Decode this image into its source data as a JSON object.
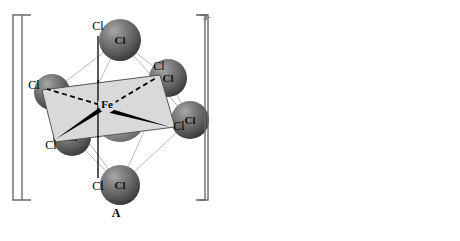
{
  "figure": {
    "charge": "3-",
    "background_color": "#ffffff"
  },
  "colors": {
    "fe_sphere_light": "#e8e8e8",
    "fe_sphere_mid": "#b4b4b4",
    "fe_sphere_dark": "#6e6e6e",
    "cl_sphere_light": "#9a9a9a",
    "cl_sphere_mid": "#6d6d6d",
    "cl_sphere_dark": "#3c3c3c",
    "bond_light": "#d0d0d0",
    "bond_dark": "#8a8a8a",
    "wireframe": "#9b9b9b",
    "bracket": "#6a6a6a",
    "plane_fill": "#d9d9d9",
    "plane_stroke": "#555555",
    "line": "#000000",
    "label_text": "#000000"
  },
  "panel_a": {
    "name": "A",
    "label": "A",
    "charge": "3-",
    "center_atom": {
      "label": "Fe",
      "cx": 120,
      "cy": 115,
      "r": 27
    },
    "ligands": [
      {
        "label": "Cl",
        "position": "top",
        "cx": 120,
        "cy": 40,
        "r": 21
      },
      {
        "label": "Cl",
        "position": "bottom",
        "cx": 120,
        "cy": 185,
        "r": 20
      },
      {
        "label": "Cl",
        "position": "left-rear",
        "cx": 52,
        "cy": 92,
        "r": 18
      },
      {
        "label": "Cl",
        "position": "lower-left",
        "cx": 72,
        "cy": 137,
        "r": 19
      },
      {
        "label": "Cl",
        "position": "upper-right",
        "cx": 168,
        "cy": 78,
        "r": 19
      },
      {
        "label": "Cl",
        "position": "right",
        "cx": 190,
        "cy": 120,
        "r": 19
      }
    ],
    "bracket": {
      "left_x": 22,
      "right_x": 205,
      "top_y": 15,
      "bottom_y": 200
    }
  },
  "panel_b": {
    "name": "B",
    "label": "B",
    "charge": "3-",
    "center_atom": {
      "label": "Fe",
      "x": 337,
      "y": 107
    },
    "ligands": [
      {
        "label": "Cl",
        "position": "axial-top",
        "bond": "plain",
        "x": 328,
        "y": 26
      },
      {
        "label": "Cl",
        "position": "axial-bottom",
        "bond": "plain",
        "x": 328,
        "y": 186
      },
      {
        "label": "Cl",
        "position": "equatorial-left-rear",
        "bond": "dashed",
        "x": 264,
        "y": 85
      },
      {
        "label": "Cl",
        "position": "equatorial-right-rear",
        "bond": "dashed",
        "x": 389,
        "y": 70
      },
      {
        "label": "Cl",
        "position": "equatorial-left-front",
        "bond": "wedge",
        "x": 281,
        "y": 144
      },
      {
        "label": "Cl",
        "position": "equatorial-right-front",
        "bond": "wedge",
        "x": 406,
        "y": 125
      }
    ],
    "plane": {
      "shape": "parallelogram",
      "vertices": [
        [
          272,
          90
        ],
        [
          390,
          75
        ],
        [
          405,
          127
        ],
        [
          285,
          142
        ]
      ]
    },
    "bracket": {
      "left_x": 243,
      "right_x": 438,
      "top_y": 15,
      "bottom_y": 200
    }
  }
}
